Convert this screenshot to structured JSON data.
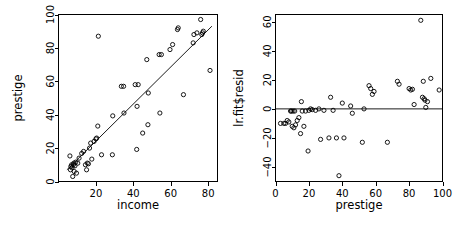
{
  "figure": {
    "title": "",
    "panel_count": 2,
    "background_color": "#ffffff",
    "foreground_color": "#000000"
  },
  "chart_data": [
    {
      "type": "scatter",
      "panel": "left",
      "title": "",
      "xlabel": "income",
      "ylabel": "prestige",
      "xlim": [
        0,
        85
      ],
      "ylim": [
        0,
        100
      ],
      "xticks": [
        20,
        40,
        60,
        80
      ],
      "yticks": [
        0,
        20,
        40,
        60,
        80,
        100
      ],
      "grid": false,
      "legend": "none",
      "point_marker": "open-circle",
      "annotations": [
        "regression line fitted through points"
      ],
      "fit_line": {
        "type": "linear",
        "x_start": 4.5,
        "y_start": 7.0,
        "x_end": 82.0,
        "y_end": 93.0
      },
      "x": [
        6.1,
        6.4,
        6.6,
        7.0,
        7.2,
        7.6,
        8.0,
        8.2,
        8.4,
        8.8,
        9.2,
        9.6,
        10.3,
        11.0,
        12.4,
        13.4,
        14.4,
        15.0,
        15.4,
        16.0,
        16.6,
        17.2,
        17.8,
        19.0,
        20.0,
        20.4,
        21.0,
        21.3,
        23.0,
        28.8,
        29.0,
        33.6,
        34.8,
        35.0,
        41.0,
        41.8,
        42.0,
        42.6,
        45.0,
        47.2,
        47.8,
        48.0,
        53.8,
        54.2,
        55.0,
        59.6,
        61.0,
        63.6,
        64.0,
        66.8,
        72.0,
        72.4,
        74.0,
        76.0,
        76.6,
        77.0,
        77.4,
        81.0
      ],
      "y": [
        15.3,
        7.0,
        9.0,
        10.0,
        8.2,
        3.0,
        10.1,
        11.0,
        6.0,
        9.4,
        11.6,
        5.0,
        11.0,
        14.0,
        16.8,
        18.0,
        10.0,
        7.0,
        11.0,
        10.6,
        20.0,
        23.0,
        13.4,
        24.0,
        25.5,
        26.0,
        33.2,
        87.0,
        16.0,
        16.0,
        39.3,
        57.0,
        57.0,
        41.0,
        58.0,
        19.2,
        45.0,
        58.0,
        29.0,
        73.0,
        34.0,
        53.0,
        76.0,
        41.0,
        76.0,
        79.0,
        82.0,
        91.0,
        92.0,
        52.0,
        83.0,
        88.0,
        89.0,
        97.0,
        88.0,
        89.0,
        90.0,
        66.5
      ]
    },
    {
      "type": "scatter",
      "panel": "right",
      "title": "",
      "xlabel": "prestige",
      "ylabel": "lr.fit$resid",
      "xlim": [
        0,
        100
      ],
      "ylim": [
        -50,
        65
      ],
      "xticks": [
        0,
        20,
        40,
        60,
        80,
        100
      ],
      "yticks": [
        -40,
        -20,
        0,
        20,
        40,
        60
      ],
      "grid": false,
      "legend": "none",
      "point_marker": "open-circle",
      "annotations": [
        "horizontal reference line at residual = 0"
      ],
      "reference_line": {
        "orientation": "horizontal",
        "value": 0
      },
      "x": [
        3.0,
        5.0,
        6.0,
        7.0,
        8.0,
        9.0,
        9.5,
        10.0,
        10.5,
        11.0,
        11.5,
        12.0,
        13.0,
        14.0,
        15.0,
        15.5,
        16.0,
        17.0,
        18.0,
        19.5,
        20.0,
        21.0,
        22.0,
        24.0,
        26.0,
        27.0,
        29.0,
        32.0,
        33.0,
        34.5,
        36.5,
        38.0,
        40.0,
        41.0,
        45.0,
        46.0,
        52.0,
        53.0,
        56.0,
        57.0,
        58.0,
        59.0,
        67.0,
        73.0,
        74.0,
        80.0,
        81.0,
        82.0,
        83.0,
        87.0,
        88.0,
        88.5,
        89.0,
        89.5,
        90.0,
        91.0,
        93.0,
        98.0
      ],
      "y": [
        -10.0,
        -10.0,
        -10.0,
        -8.0,
        -9.0,
        -1.5,
        -1.5,
        -12.0,
        -1.5,
        -13.0,
        -1.5,
        -11.0,
        -8.0,
        -6.0,
        -17.0,
        5.0,
        -1.5,
        -12.0,
        -1.5,
        -29.0,
        -1.0,
        0.0,
        -0.5,
        -1.0,
        0.0,
        -21.0,
        -1.0,
        -20.0,
        8.0,
        -1.0,
        -20.0,
        -46.0,
        4.0,
        -20.0,
        2.0,
        -3.0,
        -23.0,
        0.0,
        16.0,
        14.0,
        10.0,
        12.0,
        -23.0,
        19.0,
        17.0,
        14.0,
        13.0,
        13.5,
        3.0,
        61.0,
        8.0,
        19.0,
        7.0,
        6.0,
        1.0,
        5.0,
        21.0,
        13.0
      ]
    }
  ]
}
